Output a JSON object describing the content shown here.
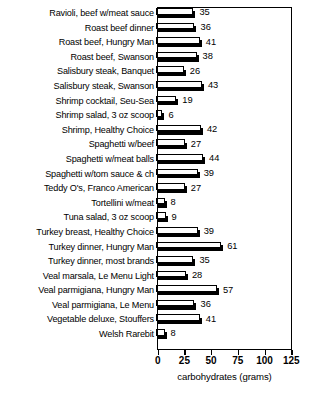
{
  "chart_data": {
    "type": "bar",
    "orientation": "horizontal",
    "title": "",
    "xlabel": "carbohydrates (grams)",
    "ylabel": "",
    "xlim": [
      0,
      125
    ],
    "xticks": [
      0,
      25,
      50,
      75,
      100,
      125
    ],
    "grid": false,
    "legend": null,
    "style": "3d-shadow-bars",
    "value_labels_shown": true,
    "categories": [
      "Ravioli, beef w/meat sauce",
      "Roast beef dinner",
      "Roast beef, Hungry Man",
      "Roast beef, Swanson",
      "Salisbury steak, Banquet",
      "Salisbury steak, Swanson",
      "Shrimp cocktail, Seu-Sea",
      "Shrimp salad, 3 oz scoop",
      "Shrimp, Healthy Choice",
      "Spaghetti w/beef",
      "Spaghetti w/meat balls",
      "Spaghetti w/tom sauce & ch",
      "Teddy O's, Franco American",
      "Tortellini w/meat",
      "Tuna salad, 3 oz scoop",
      "Turkey breast, Healthy Choice",
      "Turkey dinner, Hungry Man",
      "Turkey dinner, most brands",
      "Veal marsala, Le Menu Light",
      "Veal parmigiana, Hungry Man",
      "Veal parmigiana, Le Menu",
      "Vegetable deluxe, Stouffers",
      "Welsh Rarebit"
    ],
    "values": [
      35,
      36,
      41,
      38,
      26,
      43,
      19,
      6,
      42,
      27,
      44,
      39,
      27,
      8,
      9,
      39,
      61,
      35,
      28,
      57,
      36,
      41,
      8
    ]
  },
  "colors": {
    "bar_face": "#ffffff",
    "bar_outline": "#000000",
    "bar_shadow": "#000000",
    "axis": "#000000",
    "text": "#000000",
    "background": "#ffffff"
  }
}
